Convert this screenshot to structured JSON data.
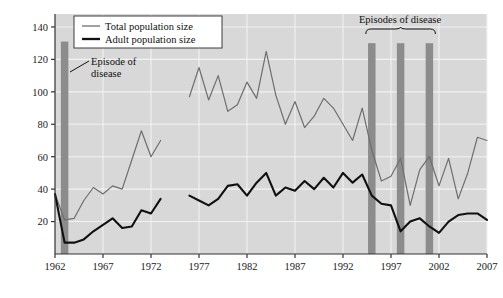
{
  "chart_data": {
    "type": "line",
    "title": "",
    "xlabel": "Year",
    "ylabel": "Number",
    "xlim": [
      1962,
      2007
    ],
    "ylim": [
      0,
      148
    ],
    "yticks": [
      20,
      40,
      60,
      80,
      100,
      120,
      140
    ],
    "xticks": [
      1962,
      1967,
      1972,
      1977,
      1982,
      1987,
      1992,
      1997,
      2002,
      2007
    ],
    "grid": true,
    "legend_position": "top-left",
    "legend": [
      "Total population size",
      "Adult population size"
    ],
    "annotations": [
      {
        "text": "Episode of disease",
        "target_year": 1963,
        "kind": "leader-line"
      },
      {
        "text": "Episodes of disease",
        "target_years": [
          1995,
          1998,
          2001
        ],
        "kind": "brace"
      }
    ],
    "disease_bands": [
      {
        "year": 1963,
        "top": 131
      },
      {
        "year": 1995,
        "top": 130
      },
      {
        "year": 1998,
        "top": 130
      },
      {
        "year": 2001,
        "top": 130
      }
    ],
    "series": [
      {
        "name": "Total population size",
        "color": "#6e6e6e",
        "width": 1.2,
        "segments": [
          {
            "x": [
              1962,
              1963,
              1964,
              1965,
              1966,
              1967,
              1968,
              1969,
              1970,
              1971,
              1972
            ],
            "y": [
              37,
              21,
              22,
              19,
              38,
              44,
              42,
              45,
              58,
              76,
              60,
              70
            ]
          }
        ],
        "points": [
          {
            "year": 1962,
            "value": 37
          },
          {
            "year": 1963,
            "value": 21
          },
          {
            "year": 1964,
            "value": 22
          },
          {
            "year": 1965,
            "value": 33
          },
          {
            "year": 1966,
            "value": 41
          },
          {
            "year": 1967,
            "value": 37
          },
          {
            "year": 1968,
            "value": 42
          },
          {
            "year": 1969,
            "value": 40
          },
          {
            "year": 1970,
            "value": 58
          },
          {
            "year": 1971,
            "value": 76
          },
          {
            "year": 1972,
            "value": 60
          },
          {
            "year": 1973,
            "value": 70
          },
          {
            "year": 1976,
            "value": 97
          },
          {
            "year": 1977,
            "value": 115
          },
          {
            "year": 1978,
            "value": 95
          },
          {
            "year": 1979,
            "value": 110
          },
          {
            "year": 1980,
            "value": 88
          },
          {
            "year": 1981,
            "value": 92
          },
          {
            "year": 1982,
            "value": 106
          },
          {
            "year": 1983,
            "value": 96
          },
          {
            "year": 1984,
            "value": 125
          },
          {
            "year": 1985,
            "value": 98
          },
          {
            "year": 1986,
            "value": 80
          },
          {
            "year": 1987,
            "value": 94
          },
          {
            "year": 1988,
            "value": 78
          },
          {
            "year": 1989,
            "value": 85
          },
          {
            "year": 1990,
            "value": 96
          },
          {
            "year": 1991,
            "value": 90
          },
          {
            "year": 1992,
            "value": 80
          },
          {
            "year": 1993,
            "value": 70
          },
          {
            "year": 1994,
            "value": 90
          },
          {
            "year": 1995,
            "value": 64
          },
          {
            "year": 1996,
            "value": 45
          },
          {
            "year": 1997,
            "value": 48
          },
          {
            "year": 1998,
            "value": 59
          },
          {
            "year": 1999,
            "value": 30
          },
          {
            "year": 2000,
            "value": 52
          },
          {
            "year": 2001,
            "value": 60
          },
          {
            "year": 2002,
            "value": 42
          },
          {
            "year": 2003,
            "value": 59
          },
          {
            "year": 2004,
            "value": 34
          },
          {
            "year": 2005,
            "value": 50
          },
          {
            "year": 2006,
            "value": 72
          },
          {
            "year": 2007,
            "value": 70
          }
        ]
      },
      {
        "name": "Adult population size",
        "color": "#111111",
        "width": 2.1,
        "points": [
          {
            "year": 1962,
            "value": 37
          },
          {
            "year": 1963,
            "value": 7
          },
          {
            "year": 1964,
            "value": 7
          },
          {
            "year": 1965,
            "value": 9
          },
          {
            "year": 1966,
            "value": 14
          },
          {
            "year": 1967,
            "value": 18
          },
          {
            "year": 1968,
            "value": 22
          },
          {
            "year": 1969,
            "value": 16
          },
          {
            "year": 1970,
            "value": 17
          },
          {
            "year": 1971,
            "value": 27
          },
          {
            "year": 1972,
            "value": 25
          },
          {
            "year": 1973,
            "value": 34
          },
          {
            "year": 1976,
            "value": 36
          },
          {
            "year": 1977,
            "value": 33
          },
          {
            "year": 1978,
            "value": 30
          },
          {
            "year": 1979,
            "value": 34
          },
          {
            "year": 1980,
            "value": 42
          },
          {
            "year": 1981,
            "value": 43
          },
          {
            "year": 1982,
            "value": 36
          },
          {
            "year": 1983,
            "value": 44
          },
          {
            "year": 1984,
            "value": 50
          },
          {
            "year": 1985,
            "value": 36
          },
          {
            "year": 1986,
            "value": 41
          },
          {
            "year": 1987,
            "value": 39
          },
          {
            "year": 1988,
            "value": 45
          },
          {
            "year": 1989,
            "value": 40
          },
          {
            "year": 1990,
            "value": 47
          },
          {
            "year": 1991,
            "value": 41
          },
          {
            "year": 1992,
            "value": 50
          },
          {
            "year": 1993,
            "value": 44
          },
          {
            "year": 1994,
            "value": 49
          },
          {
            "year": 1995,
            "value": 36
          },
          {
            "year": 1996,
            "value": 31
          },
          {
            "year": 1997,
            "value": 30
          },
          {
            "year": 1998,
            "value": 14
          },
          {
            "year": 1999,
            "value": 20
          },
          {
            "year": 2000,
            "value": 22
          },
          {
            "year": 2001,
            "value": 17
          },
          {
            "year": 2002,
            "value": 13
          },
          {
            "year": 2003,
            "value": 20
          },
          {
            "year": 2004,
            "value": 24
          },
          {
            "year": 2005,
            "value": 25
          },
          {
            "year": 2006,
            "value": 25
          },
          {
            "year": 2007,
            "value": 21
          }
        ]
      }
    ]
  },
  "colors": {
    "plot_background": "#d8d8d8",
    "gridline": "#f2f2f2",
    "band": "#8c8c8c",
    "total_line": "#6e6e6e",
    "adult_line": "#111111",
    "axis": "#333333"
  }
}
